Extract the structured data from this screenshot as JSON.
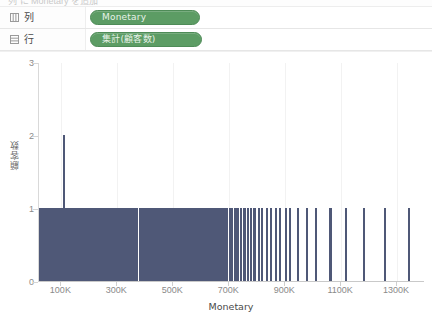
{
  "window": {
    "cut_strip_text": "列 に Monetary を追加"
  },
  "shelves": [
    {
      "key": "columns",
      "icon": "columns-grid-icon",
      "label": "列",
      "pill": {
        "label": "Monetary",
        "color": "#5c9c64",
        "wide": false
      }
    },
    {
      "key": "rows",
      "icon": "rows-list-icon",
      "label": "行",
      "pill": {
        "label": "集計(顧客数)",
        "color": "#5c9c64",
        "wide": true
      }
    }
  ],
  "chart_data": {
    "type": "bar",
    "title": "",
    "xlabel": "Monetary",
    "ylabel": "顧客数",
    "xtick_labels": [
      "100K",
      "300K",
      "500K",
      "700K",
      "900K",
      "1100K",
      "1300K"
    ],
    "xtick_values": [
      100000,
      300000,
      500000,
      700000,
      900000,
      1100000,
      1300000
    ],
    "ytick_labels": [
      "0",
      "1",
      "2",
      "3"
    ],
    "ytick_values": [
      0,
      1,
      2,
      3
    ],
    "xlim": [
      20000,
      1400000
    ],
    "ylim": [
      0,
      3
    ],
    "grid": "vertical-faint",
    "legend": "none",
    "bar_color": "#4f5877",
    "x": [
      22000,
      26000,
      30000,
      34000,
      38000,
      42000,
      46000,
      50000,
      54000,
      58000,
      62000,
      66000,
      70000,
      74000,
      78000,
      82000,
      86000,
      90000,
      94000,
      98000,
      102000,
      106000,
      110000,
      114000,
      118000,
      122000,
      126000,
      130000,
      134000,
      138000,
      142000,
      146000,
      150000,
      154000,
      158000,
      162000,
      166000,
      170000,
      174000,
      178000,
      182000,
      186000,
      190000,
      194000,
      198000,
      202000,
      206000,
      210000,
      214000,
      218000,
      222000,
      226000,
      230000,
      234000,
      238000,
      242000,
      246000,
      250000,
      254000,
      258000,
      262000,
      266000,
      270000,
      274000,
      278000,
      282000,
      286000,
      290000,
      294000,
      298000,
      302000,
      306000,
      310000,
      314000,
      318000,
      322000,
      326000,
      330000,
      334000,
      338000,
      342000,
      346000,
      350000,
      354000,
      358000,
      362000,
      366000,
      370000,
      382000,
      386000,
      390000,
      394000,
      398000,
      402000,
      406000,
      410000,
      414000,
      418000,
      422000,
      426000,
      430000,
      434000,
      438000,
      442000,
      446000,
      450000,
      454000,
      458000,
      462000,
      466000,
      470000,
      474000,
      478000,
      486000,
      490000,
      494000,
      498000,
      506000,
      510000,
      518000,
      522000,
      530000,
      534000,
      542000,
      546000,
      554000,
      562000,
      570000,
      574000,
      582000,
      590000,
      598000,
      606000,
      610000,
      618000,
      626000,
      634000,
      642000,
      650000,
      658000,
      666000,
      674000,
      682000,
      690000,
      702000,
      710000,
      722000,
      730000,
      742000,
      754000,
      766000,
      778000,
      790000,
      806000,
      818000,
      834000,
      850000,
      866000,
      882000,
      902000,
      918000,
      946000,
      978000,
      1010000,
      1062000,
      1118000,
      1182000,
      1258000,
      1342000
    ],
    "y": [
      1,
      1,
      1,
      1,
      1,
      1,
      1,
      1,
      1,
      1,
      1,
      1,
      1,
      1,
      1,
      1,
      1,
      1,
      1,
      1,
      1,
      1,
      2,
      1,
      1,
      1,
      1,
      1,
      1,
      1,
      1,
      1,
      1,
      1,
      1,
      1,
      1,
      1,
      1,
      1,
      1,
      1,
      1,
      1,
      1,
      1,
      1,
      1,
      1,
      1,
      1,
      1,
      1,
      1,
      1,
      1,
      1,
      1,
      1,
      1,
      1,
      1,
      1,
      1,
      1,
      1,
      1,
      1,
      1,
      1,
      1,
      1,
      1,
      1,
      1,
      1,
      1,
      1,
      1,
      1,
      1,
      1,
      1,
      1,
      1,
      1,
      1,
      1,
      1,
      1,
      1,
      1,
      1,
      1,
      1,
      1,
      1,
      1,
      1,
      1,
      1,
      1,
      1,
      1,
      1,
      1,
      1,
      1,
      1,
      1,
      1,
      1,
      1,
      1,
      1,
      1,
      1,
      1,
      1,
      1,
      1,
      1,
      1,
      1,
      1,
      1,
      1,
      1,
      1,
      1,
      1,
      1,
      1,
      1,
      1,
      1,
      1,
      1,
      1,
      1,
      1,
      1,
      1,
      1,
      1,
      1,
      1,
      1,
      1,
      1,
      1,
      1,
      1,
      1,
      1,
      1,
      1,
      1,
      1,
      1,
      1,
      1,
      1,
      1,
      1,
      1,
      1,
      1,
      1
    ]
  }
}
